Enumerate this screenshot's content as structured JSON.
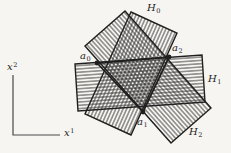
{
  "colors": {
    "background": "#f6f5f1",
    "ink": "#1f1f1f",
    "axis": "#4a4a4a",
    "hatch": "#262626"
  },
  "hatch": {
    "spacing": 3.3,
    "stroke_width": 0.8
  },
  "axes": {
    "polyline": [
      [
        13,
        75
      ],
      [
        13,
        135
      ],
      [
        60,
        135
      ]
    ],
    "x2": {
      "text": "x",
      "sup": "2",
      "label": {
        "x": 7,
        "y": 62
      }
    },
    "x1": {
      "text": "x",
      "sup": "1",
      "label": {
        "x": 64,
        "y": 128
      }
    }
  },
  "halfplanes": [
    {
      "name": "H",
      "sub": "0",
      "polygon": [
        [
          131,
          12
        ],
        [
          177,
          33
        ],
        [
          131,
          135
        ],
        [
          85,
          114
        ]
      ],
      "hatch_angle": 114,
      "label": {
        "x": 147,
        "y": 3
      }
    },
    {
      "name": "H",
      "sub": "1",
      "polygon": [
        [
          75,
          64
        ],
        [
          202,
          55
        ],
        [
          205,
          102
        ],
        [
          78,
          111
        ]
      ],
      "hatch_angle": -4,
      "label": {
        "x": 208,
        "y": 74
      }
    },
    {
      "name": "H",
      "sub": "2",
      "polygon": [
        [
          85,
          46
        ],
        [
          125,
          11
        ],
        [
          211,
          108
        ],
        [
          171,
          143
        ]
      ],
      "hatch_angle": 48,
      "label": {
        "x": 189,
        "y": 127
      }
    }
  ],
  "triangle": [
    [
      97,
      63
    ],
    [
      143,
      112
    ],
    [
      169,
      57
    ]
  ],
  "points": [
    {
      "name": "a",
      "sub": "0",
      "x": 97,
      "y": 63,
      "label": {
        "x": 80,
        "y": 51
      }
    },
    {
      "name": "a",
      "sub": "1",
      "x": 143,
      "y": 112,
      "label": {
        "x": 137,
        "y": 117
      }
    },
    {
      "name": "a",
      "sub": "2",
      "x": 169,
      "y": 57,
      "label": {
        "x": 172,
        "y": 43
      }
    }
  ]
}
